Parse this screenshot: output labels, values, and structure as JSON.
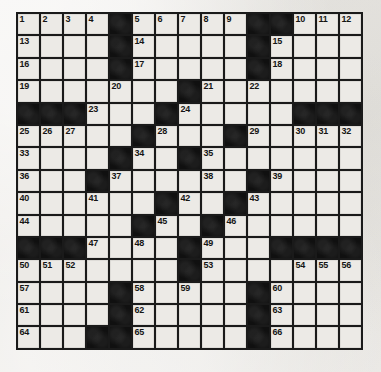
{
  "puzzle": {
    "title": "Crossword Puzzle Grid",
    "rows": 15,
    "columns": 15,
    "cell_colors": {
      "white": "#eceae6",
      "black": "#101010",
      "grid_line": "#1a1a1a",
      "page_background": "#efedea",
      "number_text": "#151515"
    },
    "total_clue_numbers": 66,
    "layout_legend": {
      "1": "white / open square",
      "0": "black / blocked square"
    },
    "grid_layout": [
      [
        1,
        1,
        1,
        1,
        0,
        1,
        1,
        1,
        1,
        1,
        0,
        0,
        1,
        1,
        1
      ],
      [
        1,
        1,
        1,
        1,
        0,
        1,
        1,
        1,
        1,
        1,
        0,
        1,
        1,
        1,
        1
      ],
      [
        1,
        1,
        1,
        1,
        0,
        1,
        1,
        1,
        1,
        1,
        0,
        1,
        1,
        1,
        1
      ],
      [
        1,
        1,
        1,
        1,
        1,
        1,
        1,
        0,
        1,
        1,
        1,
        1,
        1,
        1,
        1
      ],
      [
        0,
        0,
        0,
        1,
        1,
        1,
        0,
        1,
        1,
        1,
        1,
        1,
        0,
        0,
        0
      ],
      [
        1,
        1,
        1,
        1,
        1,
        0,
        1,
        1,
        1,
        0,
        1,
        1,
        1,
        1,
        1
      ],
      [
        1,
        1,
        1,
        1,
        0,
        1,
        1,
        0,
        1,
        1,
        1,
        1,
        1,
        1,
        1
      ],
      [
        1,
        1,
        1,
        0,
        1,
        1,
        1,
        1,
        1,
        1,
        0,
        1,
        1,
        1,
        1
      ],
      [
        1,
        1,
        1,
        1,
        1,
        1,
        0,
        1,
        1,
        0,
        1,
        1,
        1,
        1,
        1
      ],
      [
        1,
        1,
        1,
        1,
        1,
        0,
        1,
        1,
        0,
        1,
        1,
        1,
        1,
        1,
        1
      ],
      [
        0,
        0,
        0,
        1,
        1,
        1,
        1,
        0,
        1,
        1,
        1,
        0,
        0,
        0,
        0
      ],
      [
        1,
        1,
        1,
        1,
        1,
        1,
        1,
        0,
        1,
        1,
        1,
        1,
        1,
        1,
        1
      ],
      [
        1,
        1,
        1,
        1,
        0,
        1,
        1,
        1,
        1,
        1,
        0,
        1,
        1,
        1,
        1
      ],
      [
        1,
        1,
        1,
        1,
        0,
        1,
        1,
        1,
        1,
        1,
        0,
        1,
        1,
        1,
        1
      ],
      [
        1,
        1,
        1,
        0,
        0,
        1,
        1,
        1,
        1,
        1,
        0,
        1,
        1,
        1,
        1
      ]
    ],
    "numbered_cells": [
      {
        "number": 1,
        "row": 1,
        "col": 1
      },
      {
        "number": 2,
        "row": 1,
        "col": 2
      },
      {
        "number": 3,
        "row": 1,
        "col": 3
      },
      {
        "number": 4,
        "row": 1,
        "col": 4
      },
      {
        "number": 5,
        "row": 1,
        "col": 6
      },
      {
        "number": 6,
        "row": 1,
        "col": 7
      },
      {
        "number": 7,
        "row": 1,
        "col": 8
      },
      {
        "number": 8,
        "row": 1,
        "col": 9
      },
      {
        "number": 9,
        "row": 1,
        "col": 10
      },
      {
        "number": 10,
        "row": 1,
        "col": 13
      },
      {
        "number": 11,
        "row": 1,
        "col": 14
      },
      {
        "number": 12,
        "row": 1,
        "col": 15
      },
      {
        "number": 13,
        "row": 2,
        "col": 1
      },
      {
        "number": 14,
        "row": 2,
        "col": 6
      },
      {
        "number": 15,
        "row": 2,
        "col": 12
      },
      {
        "number": 16,
        "row": 3,
        "col": 1
      },
      {
        "number": 17,
        "row": 3,
        "col": 6
      },
      {
        "number": 18,
        "row": 3,
        "col": 12
      },
      {
        "number": 19,
        "row": 4,
        "col": 1
      },
      {
        "number": 20,
        "row": 4,
        "col": 5
      },
      {
        "number": 21,
        "row": 4,
        "col": 9
      },
      {
        "number": 22,
        "row": 4,
        "col": 11
      },
      {
        "number": 23,
        "row": 5,
        "col": 4
      },
      {
        "number": 24,
        "row": 5,
        "col": 8
      },
      {
        "number": 25,
        "row": 6,
        "col": 1
      },
      {
        "number": 26,
        "row": 6,
        "col": 2
      },
      {
        "number": 27,
        "row": 6,
        "col": 3
      },
      {
        "number": 28,
        "row": 6,
        "col": 7
      },
      {
        "number": 29,
        "row": 6,
        "col": 11
      },
      {
        "number": 30,
        "row": 6,
        "col": 13
      },
      {
        "number": 31,
        "row": 6,
        "col": 14
      },
      {
        "number": 32,
        "row": 6,
        "col": 15
      },
      {
        "number": 33,
        "row": 7,
        "col": 1
      },
      {
        "number": 34,
        "row": 7,
        "col": 6
      },
      {
        "number": 35,
        "row": 7,
        "col": 9
      },
      {
        "number": 36,
        "row": 8,
        "col": 1
      },
      {
        "number": 37,
        "row": 8,
        "col": 5
      },
      {
        "number": 38,
        "row": 8,
        "col": 9
      },
      {
        "number": 39,
        "row": 8,
        "col": 12
      },
      {
        "number": 40,
        "row": 9,
        "col": 1
      },
      {
        "number": 41,
        "row": 9,
        "col": 4
      },
      {
        "number": 42,
        "row": 9,
        "col": 8
      },
      {
        "number": 43,
        "row": 9,
        "col": 11
      },
      {
        "number": 44,
        "row": 10,
        "col": 1
      },
      {
        "number": 45,
        "row": 10,
        "col": 7
      },
      {
        "number": 46,
        "row": 10,
        "col": 10
      },
      {
        "number": 47,
        "row": 11,
        "col": 4
      },
      {
        "number": 48,
        "row": 11,
        "col": 6
      },
      {
        "number": 49,
        "row": 11,
        "col": 9
      },
      {
        "number": 50,
        "row": 12,
        "col": 1
      },
      {
        "number": 51,
        "row": 12,
        "col": 2
      },
      {
        "number": 52,
        "row": 12,
        "col": 3
      },
      {
        "number": 53,
        "row": 12,
        "col": 9
      },
      {
        "number": 54,
        "row": 12,
        "col": 13
      },
      {
        "number": 55,
        "row": 12,
        "col": 14
      },
      {
        "number": 56,
        "row": 12,
        "col": 15
      },
      {
        "number": 57,
        "row": 13,
        "col": 1
      },
      {
        "number": 58,
        "row": 13,
        "col": 6
      },
      {
        "number": 59,
        "row": 13,
        "col": 8
      },
      {
        "number": 60,
        "row": 13,
        "col": 12
      },
      {
        "number": 61,
        "row": 14,
        "col": 1
      },
      {
        "number": 62,
        "row": 14,
        "col": 6
      },
      {
        "number": 63,
        "row": 14,
        "col": 12
      },
      {
        "number": 64,
        "row": 15,
        "col": 1
      },
      {
        "number": 65,
        "row": 15,
        "col": 6
      },
      {
        "number": 66,
        "row": 15,
        "col": 12
      }
    ]
  }
}
